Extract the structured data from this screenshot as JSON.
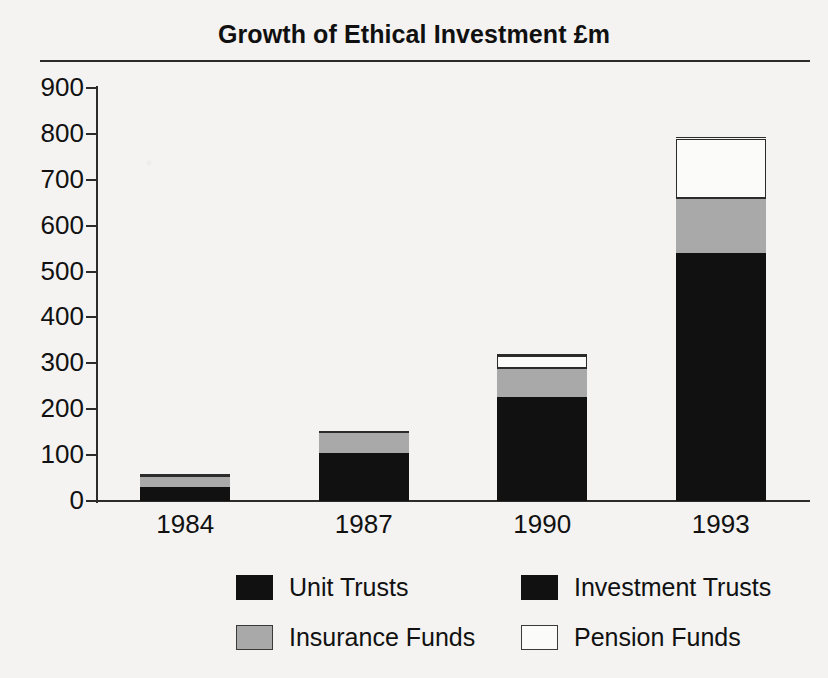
{
  "chart_data": {
    "type": "bar",
    "subtype": "stacked-bar",
    "title": "Growth of Ethical Investment £m",
    "xlabel": "",
    "ylabel": "",
    "categories": [
      "1984",
      "1987",
      "1990",
      "1993"
    ],
    "ylim": [
      0,
      900
    ],
    "yticks": [
      0,
      100,
      200,
      300,
      400,
      500,
      600,
      700,
      800,
      900
    ],
    "ytick_labels": [
      "0",
      "100",
      "200",
      "300",
      "400",
      "500",
      "600",
      "700",
      "800",
      "900"
    ],
    "grid": false,
    "legend_position": "bottom",
    "units": "£m",
    "series": [
      {
        "name": "Unit Trusts",
        "color": "#111111",
        "values": [
          15,
          55,
          115,
          445
        ]
      },
      {
        "name": "Investment Trusts",
        "color": "#111111",
        "values": [
          15,
          50,
          112,
          95
        ]
      },
      {
        "name": "Insurance Funds",
        "color": "#a9a9a9",
        "values": [
          25,
          45,
          62,
          120
        ]
      },
      {
        "name": "Pension Funds",
        "color": "#ffffff",
        "values": [
          0,
          0,
          28,
          130
        ]
      }
    ],
    "totals": [
      55,
      150,
      317,
      790
    ]
  },
  "legend": {
    "items": [
      {
        "label": "Unit Trusts",
        "swatch": "unit",
        "color": "#111111"
      },
      {
        "label": "Investment Trusts",
        "swatch": "investment",
        "color": "#111111"
      },
      {
        "label": "Insurance Funds",
        "swatch": "insurance",
        "color": "#a9a9a9"
      },
      {
        "label": "Pension Funds",
        "swatch": "pension",
        "color": "#ffffff"
      }
    ]
  },
  "axes": {
    "y_labels": [
      "900",
      "800",
      "700",
      "600",
      "500",
      "400",
      "300",
      "200",
      "100",
      "0"
    ],
    "x_labels": [
      "1984",
      "1987",
      "1990",
      "1993"
    ]
  }
}
